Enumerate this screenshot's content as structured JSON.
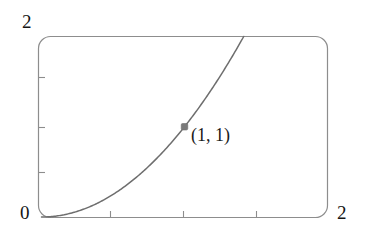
{
  "figure": {
    "background_color": "#ffffff",
    "frame_color": "#8d8d8d",
    "curve_color": "#6e6e6e",
    "marker_color": "#7a7a7a",
    "text_color": "#151515"
  },
  "labels": {
    "y_max": "2",
    "origin": "0",
    "x_max": "2",
    "point": "(1, 1)"
  },
  "chart_data": {
    "type": "line",
    "title": "",
    "xlabel": "",
    "ylabel": "",
    "xlim": [
      0,
      2
    ],
    "ylim": [
      0,
      2
    ],
    "xticks": [
      0,
      0.5,
      1.0,
      1.5,
      2.0
    ],
    "yticks": [
      0,
      0.5,
      1.0,
      1.5,
      2.0
    ],
    "xtick_labels": [
      "0",
      "",
      "",
      "",
      "2"
    ],
    "ytick_labels": [
      "0",
      "",
      "",
      "",
      "2"
    ],
    "grid": false,
    "legend": null,
    "series": [
      {
        "name": "y = x^2",
        "x": [
          0.0,
          0.1,
          0.2,
          0.3,
          0.4,
          0.5,
          0.6,
          0.7,
          0.8,
          0.9,
          1.0,
          1.1,
          1.2,
          1.3,
          1.4,
          1.4142
        ],
        "y": [
          0.0,
          0.01,
          0.04,
          0.09,
          0.16,
          0.25,
          0.36,
          0.49,
          0.64,
          0.81,
          1.0,
          1.21,
          1.44,
          1.69,
          1.96,
          2.0
        ]
      }
    ],
    "annotations": [
      {
        "label": "(1, 1)",
        "x": 1,
        "y": 1,
        "marker": "square"
      }
    ]
  }
}
